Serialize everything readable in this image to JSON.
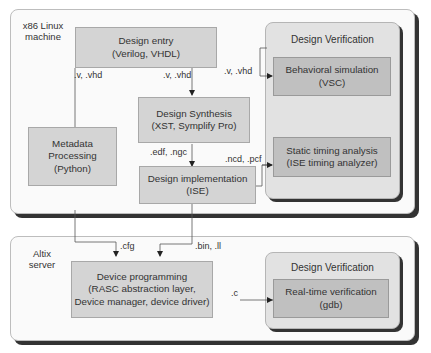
{
  "machines": {
    "linux": {
      "label_line1": "x86 Linux",
      "label_line2": "machine"
    },
    "altix": {
      "label_line1": "Altix",
      "label_line2": "server"
    }
  },
  "verification_panels": [
    {
      "title": "Design Verification"
    },
    {
      "title": "Design Verification"
    }
  ],
  "nodes": {
    "design_entry": {
      "line1": "Design entry",
      "line2": "(Verilog, VHDL)"
    },
    "design_synthesis": {
      "line1": "Design Synthesis",
      "line2": "(XST, Symplify Pro)"
    },
    "design_implementation": {
      "line1": "Design implementation",
      "line2": "(ISE)"
    },
    "metadata_processing": {
      "line1": "Metadata",
      "line2": "Processing",
      "line3": "(Python)"
    },
    "behavioral_simulation": {
      "line1": "Behavioral simulation",
      "line2": "(VSC)"
    },
    "static_timing": {
      "line1": "Static timing analysis",
      "line2": "(ISE timing analyzer)"
    },
    "device_programming": {
      "line1": "Device programming",
      "line2": "(RASC abstraction layer,",
      "line3": "Device manager, device driver)"
    },
    "realtime_verification": {
      "line1": "Real-time verification",
      "line2": "(gdb)"
    }
  },
  "edges": {
    "entry_to_metadata": ".v, .vhd",
    "entry_to_synthesis": ".v, .vhd",
    "entry_to_behavioral": ".v, .vhd",
    "synthesis_to_implementation": ".edf, .ngc",
    "implementation_to_timing": ".ncd, .pcf",
    "metadata_to_programming": ".cfg",
    "implementation_to_programming": ".bin, .ll",
    "programming_to_realtime": ".c"
  }
}
